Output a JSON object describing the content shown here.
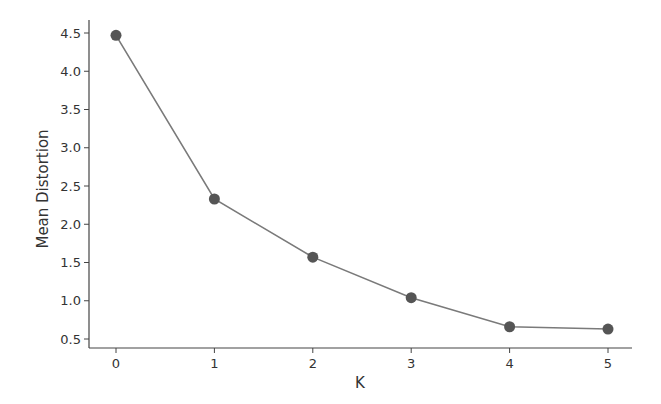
{
  "chart_data": {
    "type": "line",
    "title": "",
    "xlabel": "K",
    "ylabel": "Mean Distortion",
    "x": [
      0,
      1,
      2,
      3,
      4,
      5
    ],
    "categories": [
      "0",
      "1",
      "2",
      "3",
      "4",
      "5"
    ],
    "values": [
      4.47,
      2.33,
      1.57,
      1.04,
      0.66,
      0.63
    ],
    "series": [
      {
        "name": "Mean Distortion",
        "values": [
          4.47,
          2.33,
          1.57,
          1.04,
          0.66,
          0.63
        ]
      }
    ],
    "xticks": [
      "0",
      "1",
      "2",
      "3",
      "4",
      "5"
    ],
    "yticks": [
      "0.5",
      "1.0",
      "1.5",
      "2.0",
      "2.5",
      "3.0",
      "3.5",
      "4.0",
      "4.5"
    ],
    "ylim": [
      0.4,
      4.7
    ],
    "xlim": [
      -0.25,
      5.25
    ],
    "grid": false,
    "legend": null,
    "marker": "circle",
    "colors": {
      "line": "#7a7a7a",
      "marker": "#555555",
      "axis": "#444444"
    }
  }
}
